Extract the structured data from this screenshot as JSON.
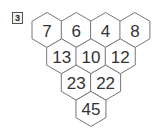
{
  "problem_number": "3",
  "pyramid": {
    "rows": [
      [
        "7",
        "6",
        "4",
        "8"
      ],
      [
        "13",
        "10",
        "12"
      ],
      [
        "23",
        "22"
      ],
      [
        "45"
      ]
    ]
  }
}
